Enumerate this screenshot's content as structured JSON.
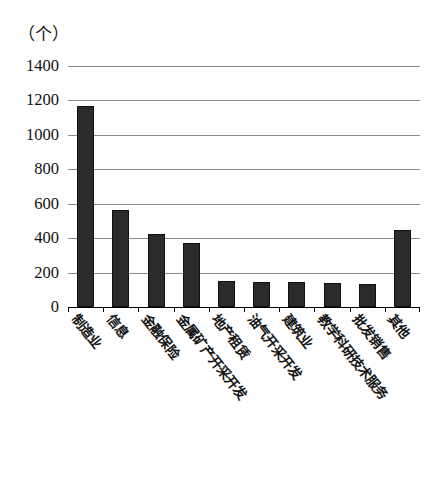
{
  "chart_data": {
    "type": "bar",
    "title": "",
    "subtitle": "",
    "unit_label": "（个）",
    "xlabel": "",
    "ylabel": "",
    "ylim": [
      0,
      1400
    ],
    "ytick_step": 200,
    "yticks": [
      1400,
      1200,
      1000,
      800,
      600,
      400,
      200,
      0
    ],
    "grid": true,
    "legend": "none",
    "bar_color": "#2b2b2b",
    "gridline_color": "#8a8a8a",
    "axis_color": "#000000",
    "categories": [
      "制造业",
      "信息",
      "金融保险",
      "金属矿产开采开发",
      "地产租赁",
      "油气开采开发",
      "建筑业",
      "教学科研技术服务",
      "批发销售",
      "其他"
    ],
    "values": [
      1165,
      565,
      425,
      370,
      150,
      145,
      145,
      140,
      135,
      450
    ]
  }
}
